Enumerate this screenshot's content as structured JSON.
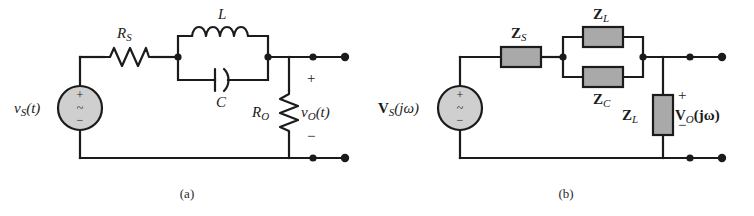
{
  "figure": {
    "background_color": "#ffffff",
    "wire_color": "#1b1b1b",
    "impedance_fill": "#a9a9a9",
    "source_fill": "#cfcfcf"
  },
  "panel_a": {
    "caption": "(a)",
    "source": {
      "label_main": "v",
      "label_sub": "S",
      "label_arg": "(t)",
      "plus_glyph": "+",
      "ac_glyph": "~",
      "minus_glyph": "−"
    },
    "components": [
      {
        "name": "series-resistor",
        "type": "resistor",
        "label_main": "R",
        "label_sub": "S"
      },
      {
        "name": "inductor",
        "type": "inductor",
        "label_main": "L",
        "label_sub": ""
      },
      {
        "name": "capacitor",
        "type": "capacitor",
        "label_main": "C",
        "label_sub": ""
      },
      {
        "name": "load-resistor",
        "type": "resistor",
        "label_main": "R",
        "label_sub": "O"
      }
    ],
    "output": {
      "label_main": "v",
      "label_sub": "O",
      "label_arg": "(t)",
      "plus_sign": "+",
      "minus_sign": "−"
    }
  },
  "panel_b": {
    "caption": "(b)",
    "source": {
      "label_main": "V",
      "label_sub": "S",
      "label_arg": "(jω)",
      "plus_glyph": "+",
      "ac_glyph": "~",
      "minus_glyph": "−"
    },
    "components": [
      {
        "name": "series-impedance",
        "type": "impedance",
        "label_main": "Z",
        "label_sub": "S"
      },
      {
        "name": "inductor-impedance",
        "type": "impedance",
        "label_main": "Z",
        "label_sub": "L"
      },
      {
        "name": "capacitor-impedance",
        "type": "impedance",
        "label_main": "Z",
        "label_sub": "C"
      },
      {
        "name": "load-impedance",
        "type": "impedance",
        "label_main": "Z",
        "label_sub": "L"
      }
    ],
    "output": {
      "label_main": "V",
      "label_sub": "O",
      "label_arg": "(jω)",
      "plus_sign": "+",
      "minus_sign": "−"
    }
  }
}
